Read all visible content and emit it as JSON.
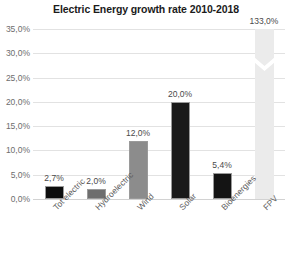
{
  "chart_data": {
    "type": "bar",
    "title": "Electric Energy growth rate 2010-2018",
    "xlabel": "",
    "ylabel": "",
    "categories": [
      "Tot electric",
      "Hydroelectric",
      "Wind",
      "Solar",
      "Bioenergies",
      "FPV"
    ],
    "values": [
      2.7,
      2.0,
      12.0,
      20.0,
      5.4,
      133.0
    ],
    "value_labels": [
      "2,7%",
      "2,0%",
      "12,0%",
      "20,0%",
      "5,4%",
      "133,0%"
    ],
    "bar_colors": [
      "#0d0d0d",
      "#6e6e6e",
      "#8c8c8c",
      "#1a1a1a",
      "#141414",
      "#ebebeb"
    ],
    "ylim": [
      0,
      35
    ],
    "ytick_values": [
      0,
      5,
      10,
      15,
      20,
      25,
      30,
      35
    ],
    "ytick_labels": [
      "0,0%",
      "5,0%",
      "10,0%",
      "15,0%",
      "20,0%",
      "25,0%",
      "30,0%",
      "35,0%"
    ],
    "grid": true,
    "legend": "none",
    "axis_break": {
      "present": true,
      "series": "FPV",
      "note": "FPV bar truncated with V-shaped break; true value 133,0% exceeds axis max 35,0%"
    },
    "decimal_separator": ","
  },
  "colors": {
    "background": "#ffffff",
    "gridline": "#e2e2e2",
    "baseline": "#d2d2d2",
    "title_text": "#1b1b1b",
    "tick_text": "#6d6d6d",
    "label_text": "#4a4a4a",
    "category_text": "#5e5e5e"
  }
}
